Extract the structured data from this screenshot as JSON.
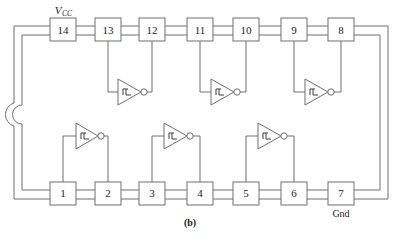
{
  "figure": {
    "caption": "(b)",
    "package_type": "14-pin DIP"
  },
  "labels": {
    "vcc_symbol": "V",
    "vcc_subscript": "CC",
    "gnd": "Gnd"
  },
  "pins": {
    "top_row": [
      {
        "number": "14",
        "x": 63,
        "y": 31
      },
      {
        "number": "13",
        "x": 108,
        "y": 31
      },
      {
        "number": "12",
        "x": 152,
        "y": 31
      },
      {
        "number": "11",
        "x": 200,
        "y": 31
      },
      {
        "number": "10",
        "x": 246,
        "y": 31
      },
      {
        "number": "9",
        "x": 294,
        "y": 31
      },
      {
        "number": "8",
        "x": 341,
        "y": 31
      }
    ],
    "bottom_row": [
      {
        "number": "1",
        "x": 63,
        "y": 194
      },
      {
        "number": "2",
        "x": 108,
        "y": 194
      },
      {
        "number": "3",
        "x": 152,
        "y": 194
      },
      {
        "number": "4",
        "x": 200,
        "y": 194
      },
      {
        "number": "5",
        "x": 246,
        "y": 194
      },
      {
        "number": "6",
        "x": 294,
        "y": 194
      },
      {
        "number": "7",
        "x": 341,
        "y": 194
      }
    ]
  },
  "gates": [
    {
      "name": "gate-1",
      "input_pin": "1",
      "output_pin": "2",
      "row": "bottom",
      "cx": 88,
      "cy": 143
    },
    {
      "name": "gate-2",
      "input_pin": "3",
      "output_pin": "4",
      "row": "bottom",
      "cx": 176,
      "cy": 143
    },
    {
      "name": "gate-3",
      "input_pin": "5",
      "output_pin": "6",
      "row": "bottom",
      "cx": 270,
      "cy": 143
    },
    {
      "name": "gate-4",
      "input_pin": "13",
      "output_pin": "12",
      "row": "top",
      "cx": 130,
      "cy": 87
    },
    {
      "name": "gate-5",
      "input_pin": "11",
      "output_pin": "10",
      "row": "top",
      "cx": 223,
      "cy": 87
    },
    {
      "name": "gate-6",
      "input_pin": "9",
      "output_pin": "8",
      "row": "top",
      "cx": 317,
      "cy": 87
    }
  ],
  "colors": {
    "line": "#6e6e72",
    "text": "#1a1a1a",
    "background": "#ffffff",
    "gate_detail": "#3a3a3e"
  }
}
